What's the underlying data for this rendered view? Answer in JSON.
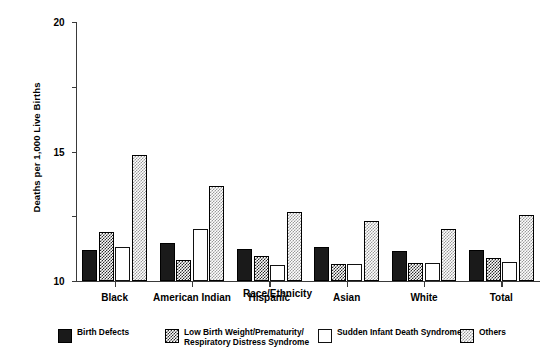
{
  "chart_data": {
    "type": "bar",
    "title": "",
    "subtitle": "",
    "xlabel": "Race/Ethnicity",
    "ylabel": "Deaths per 1,000 Live Births",
    "ylim": [
      0,
      20
    ],
    "yticks": [
      0,
      5,
      10,
      15,
      20
    ],
    "ytick_labels": [
      "0",
      "5",
      "10",
      "15",
      "20"
    ],
    "grid": false,
    "legend_position": "bottom",
    "categories": [
      "Black",
      "American Indian",
      "Hispanic",
      "Asian",
      "White",
      "Total"
    ],
    "series": [
      {
        "name": "Birth Defects",
        "pattern": "solid-black",
        "color": "#1a1a1a",
        "values": [
          2.4,
          2.9,
          2.5,
          2.6,
          2.3,
          2.4
        ]
      },
      {
        "name": "Low Birth Weight/Prematurity/\nRespiratory Distress Syndrome",
        "pattern": "dark-checker",
        "color": "#2b2b2b",
        "values": [
          3.8,
          1.6,
          1.9,
          1.3,
          1.4,
          1.8
        ]
      },
      {
        "name": "Sudden Infant Death Syndrome",
        "pattern": "empty-white",
        "color": "#ffffff",
        "values": [
          2.6,
          4.0,
          1.2,
          1.3,
          1.4,
          1.5
        ]
      },
      {
        "name": "Others",
        "pattern": "light-dotted",
        "color": "#9a9a9a",
        "values": [
          9.7,
          7.3,
          5.3,
          4.6,
          4.0,
          5.1
        ]
      }
    ]
  },
  "legend": {
    "items": [
      {
        "label": "Birth Defects",
        "swatch": "solid-black"
      },
      {
        "label": "Low Birth Weight/Prematurity/\nRespiratory Distress Syndrome",
        "swatch": "dark-checker"
      },
      {
        "label": "Sudden Infant Death Syndrome",
        "swatch": "empty-white"
      },
      {
        "label": "Others",
        "swatch": "light-dotted"
      }
    ]
  }
}
